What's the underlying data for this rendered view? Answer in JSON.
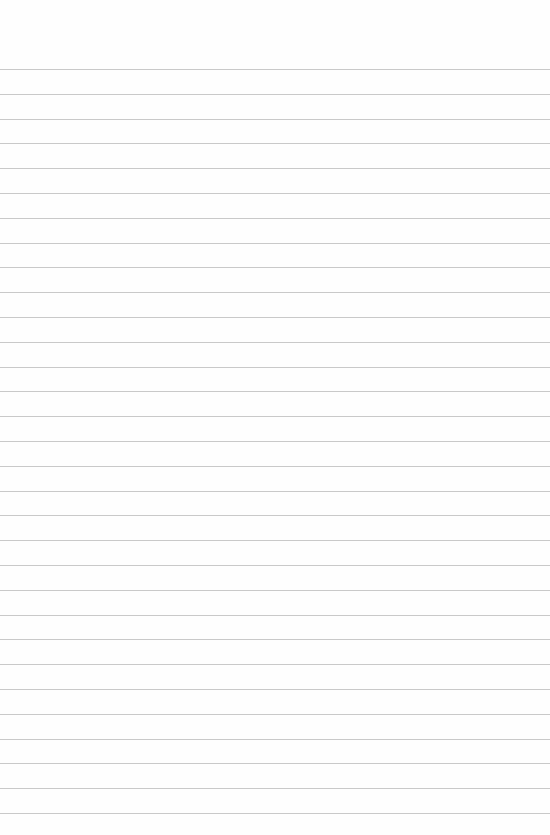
{
  "page": {
    "type": "lined-paper",
    "background_color": "#fefefe",
    "rule_color": "#c9c9c9",
    "first_rule_y": 69,
    "rule_spacing": 24.8,
    "rule_count": 31
  }
}
